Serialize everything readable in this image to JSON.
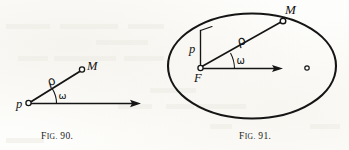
{
  "page": {
    "background_color": "#fdfdfb",
    "ink_color": "#151515",
    "width": 349,
    "height": 150
  },
  "figures": [
    {
      "id": "fig-90",
      "caption_prefix": "F",
      "caption_rest": "IG.",
      "caption_number": "90.",
      "caption_full": "FIG. 90.",
      "description": "Polar coordinate system: pole, polar axis and a point M with radius vector rho and polar angle omega",
      "labels": {
        "pole": "p",
        "radius_vector": "ρ",
        "angle": "ω",
        "point": "M"
      },
      "geometry": {
        "pole_point": [
          27,
          103
        ],
        "axis_end": [
          140,
          103
        ],
        "point_m": [
          82,
          70
        ],
        "angle_degrees": 31,
        "arc_radius": 27
      }
    },
    {
      "id": "fig-91",
      "caption_prefix": "F",
      "caption_rest": "IG.",
      "caption_number": "91.",
      "caption_full": "FIG. 91.",
      "description": "Ellipse with focus F, semi-latus rectum p, radius vector rho to point M on the curve, polar angle omega, and the second focus marked at the right",
      "labels": {
        "focus": "F",
        "semi_latus_rectum": "p",
        "radius_vector": "ρ",
        "angle": "ω",
        "point": "M",
        "second_focus": "○"
      },
      "geometry": {
        "ellipse_center": [
          252,
          66
        ],
        "ellipse_rx": 84,
        "ellipse_ry": 53,
        "focus_point": [
          200,
          68
        ],
        "latus_top": [
          200,
          30
        ],
        "point_m": [
          283,
          21
        ],
        "axis_end": [
          282,
          68
        ],
        "second_focus_point": [
          307,
          68
        ],
        "angle_degrees": 30,
        "arc_radius": 34
      }
    }
  ]
}
